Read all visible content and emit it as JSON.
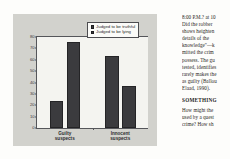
{
  "chart_data": {
    "type": "bar",
    "title": "",
    "xlabel": "",
    "ylabel": "",
    "ylim": [
      0,
      80
    ],
    "yticks": [
      0,
      10,
      20,
      30,
      40,
      50,
      60,
      70,
      80
    ],
    "ytick_labels": [
      "0",
      "10",
      "20",
      "30",
      "40",
      "50",
      "60",
      "70",
      "80"
    ],
    "grid": false,
    "legend_position": "top-right",
    "categories": [
      "Guilty suspects",
      "Innocent suspects"
    ],
    "category_lines": [
      [
        "Guilty",
        "suspects"
      ],
      [
        "Innocent",
        "suspects"
      ]
    ],
    "series": [
      {
        "name": "Judged to be truthful",
        "values": [
          24,
          63
        ],
        "color": "#3b3b3e"
      },
      {
        "name": "Judged to be lying",
        "values": [
          76,
          37
        ],
        "color": "#3b3b3e"
      }
    ]
  },
  "figure": {
    "background_color": "#d2d2cd",
    "plot_background_color": "#f4f4f0",
    "axis_color": "#55565a"
  },
  "legend": {
    "entries": [
      {
        "label": "Judged to be truthful"
      },
      {
        "label": "Judged to be lying"
      }
    ]
  },
  "text_column": {
    "paragraph_lines": [
      "8:00 P.M.? at 10",
      "Did the robber",
      "shows heighten",
      "details of the",
      "knowledge\"—k",
      "mitted the crim",
      "possess. The gu",
      "tested, identifies",
      "rarely makes the",
      "as guilty (Ballou",
      "Elaad, 1990)."
    ],
    "heading": "SOMETHING",
    "closing_lines": [
      "How might the",
      "used by a quest",
      "crime? How sh"
    ]
  }
}
